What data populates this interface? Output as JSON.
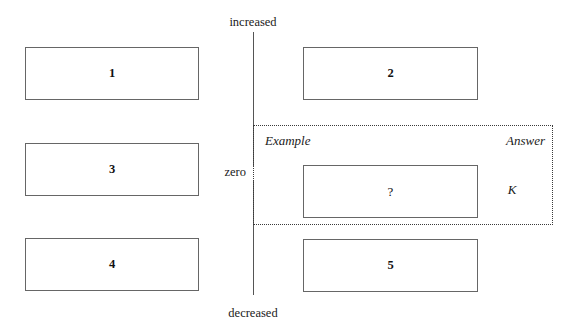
{
  "axis": {
    "top_label": "increased",
    "middle_label": "zero",
    "bottom_label": "decreased"
  },
  "region": {
    "example_caption": "Example",
    "answer_caption": "Answer",
    "answer_value": "K"
  },
  "left_column": {
    "boxes": [
      {
        "label": "1"
      },
      {
        "label": "3"
      },
      {
        "label": "4"
      }
    ]
  },
  "right_column": {
    "boxes": [
      {
        "label": "2"
      },
      {
        "label": "?"
      },
      {
        "label": "5"
      }
    ]
  },
  "colors": {
    "background": "#ffffff",
    "box_border": "#666666",
    "axis": "#555555",
    "dotted_border": "#3a3a3a",
    "text": "#1a1a1a"
  }
}
